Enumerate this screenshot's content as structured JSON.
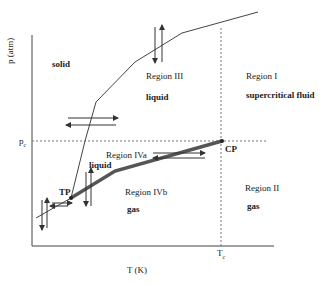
{
  "axes": {
    "ylabel": "p (atm)",
    "xlabel": "T (K)",
    "pc_label": "p",
    "pc_sub": "c",
    "tc_label": "T",
    "tc_sub": "c"
  },
  "points": {
    "triple": "TP",
    "critical": "CP"
  },
  "regions": {
    "solid": "solid",
    "region3": "Region III",
    "region3_phase": "liquid",
    "region1": "Region I",
    "region1_phase": "supercritical fluid",
    "region4a": "Region IVa",
    "region4a_phase": "liquid",
    "region4b": "Region IVb",
    "region4b_phase": "gas",
    "region2": "Region II",
    "region2_phase": "gas"
  },
  "colors": {
    "line": "#444444",
    "thick_line": "#555555",
    "dotted": "#777777"
  }
}
